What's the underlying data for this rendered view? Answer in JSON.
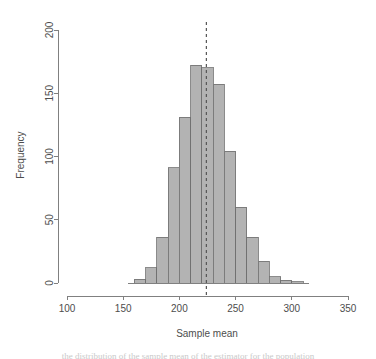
{
  "chart_data": {
    "type": "bar",
    "title": "",
    "subtitle": "",
    "xlabel": "Sample mean",
    "ylabel": "Frequency",
    "xlim": [
      100,
      350
    ],
    "ylim": [
      0,
      200
    ],
    "grid": false,
    "legend": null,
    "bin_width": 10,
    "bin_starts": [
      160,
      170,
      180,
      190,
      200,
      210,
      220,
      230,
      240,
      250,
      260,
      270,
      280,
      290,
      300
    ],
    "categories": [
      "160-170",
      "170-180",
      "180-190",
      "190-200",
      "200-210",
      "210-220",
      "220-230",
      "230-240",
      "240-250",
      "250-260",
      "260-270",
      "270-280",
      "280-290",
      "290-300",
      "300-310"
    ],
    "values": [
      3,
      12,
      36,
      91,
      131,
      172,
      170,
      157,
      104,
      60,
      36,
      17,
      5,
      2,
      1
    ],
    "x_ticks": [
      100,
      150,
      200,
      250,
      300,
      350
    ],
    "x_tick_labels": [
      "100",
      "150",
      "200",
      "250",
      "300",
      "350"
    ],
    "y_ticks": [
      0,
      50,
      100,
      150,
      200
    ],
    "y_tick_labels": [
      "0",
      "50",
      "100",
      "150",
      "200"
    ],
    "annotations": [
      {
        "name": "mean-reference-line",
        "type": "vline",
        "x": 224,
        "style": "dashed",
        "color": "#555555"
      }
    ],
    "colors": {
      "bar_fill": "#b3b3b3",
      "bar_stroke": "#6e6e6e",
      "axis": "#808080",
      "text": "#4d4d4d",
      "mean_line": "#555555"
    }
  },
  "caption": {
    "text": "the distribution of the sample mean of the estimator for the population"
  }
}
